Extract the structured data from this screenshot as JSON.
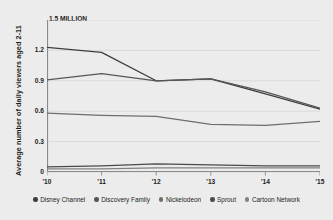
{
  "chart_data": {
    "type": "line",
    "title": "",
    "xlabel": "",
    "ylabel": "Average number of daily viewers aged 2-11",
    "unit_label": "1.5 MILLION",
    "x": [
      "'10",
      "'11",
      "'12",
      "'13",
      "'14",
      "'15"
    ],
    "categories": [
      "'10",
      "'11",
      "'12",
      "'13",
      "'14",
      "'15"
    ],
    "ylim": [
      0,
      1.5
    ],
    "yticks": [
      0,
      0.3,
      0.6,
      0.9,
      1.2,
      1.5
    ],
    "ytick_labels": [
      "0",
      "0.3",
      "0.6",
      "0.9",
      "1.2",
      "1.5 MILLION"
    ],
    "grid": true,
    "legend_position": "bottom",
    "series": [
      {
        "name": "Disney Channel",
        "color": "#3d3d3d",
        "values": [
          1.23,
          1.18,
          0.9,
          0.92,
          0.77,
          0.62
        ]
      },
      {
        "name": "Discovery Family",
        "color": "#565656",
        "values": [
          0.91,
          0.97,
          0.9,
          0.92,
          0.79,
          0.63
        ]
      },
      {
        "name": "Nickelodeon",
        "color": "#6e6e6e",
        "values": [
          0.58,
          0.56,
          0.55,
          0.47,
          0.46,
          0.5
        ]
      },
      {
        "name": "Sprout",
        "color": "#4a4a4a",
        "values": [
          0.05,
          0.06,
          0.08,
          0.07,
          0.06,
          0.06
        ]
      },
      {
        "name": "Cartoon Network",
        "color": "#828282",
        "values": [
          0.03,
          0.03,
          0.04,
          0.04,
          0.04,
          0.04
        ]
      }
    ],
    "colors": {
      "background": "#ececec",
      "grid": "#d2d2d2",
      "axis": "#8a8a8a",
      "text": "#1c1c1c"
    }
  }
}
